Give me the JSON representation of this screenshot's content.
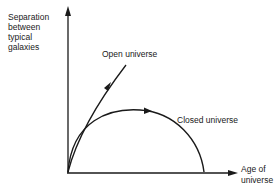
{
  "figure": {
    "y_axis_label": [
      "Separation",
      "between",
      "typical",
      "galaxies"
    ],
    "x_axis_label": [
      "Age of",
      "universe"
    ],
    "curves": [
      {
        "name": "open",
        "label": "Open universe"
      },
      {
        "name": "closed",
        "label": "Closed universe"
      }
    ]
  },
  "colors": {
    "ink": "#1a1a1a",
    "background": "#ffffff"
  }
}
